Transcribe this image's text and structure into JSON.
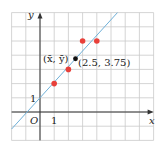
{
  "chart_data": {
    "type": "scatter",
    "title": "",
    "xlabel": "x",
    "ylabel": "y",
    "xlim": [
      -2,
      8
    ],
    "ylim": [
      -2,
      7
    ],
    "grid": true,
    "origin_label": "O",
    "tick_labels": {
      "x": [
        "1"
      ],
      "y": [
        "1"
      ]
    },
    "series": [
      {
        "name": "data points",
        "color": "#e8403a",
        "points": [
          [
            1,
            2
          ],
          [
            2,
            3
          ],
          [
            3,
            5
          ],
          [
            4,
            5
          ]
        ]
      },
      {
        "name": "mean point",
        "color": "#111111",
        "points": [
          [
            2.5,
            3.75
          ]
        ]
      },
      {
        "name": "regression line",
        "type": "line",
        "color": "#6fb0d8",
        "equation": "y = 1.1x + 1",
        "slope": 1.1,
        "intercept": 1
      }
    ],
    "annotations": [
      {
        "text": "(x̄, ȳ)",
        "at": [
          2.5,
          3.75
        ],
        "position": "left"
      },
      {
        "text": "(2.5, 3.75)",
        "at": [
          2.5,
          3.75
        ],
        "position": "right-below"
      }
    ]
  },
  "labels": {
    "x_axis": "x",
    "y_axis": "y",
    "origin": "O",
    "x_tick_1": "1",
    "y_tick_1": "1",
    "mean_symbol": "(x̄, ȳ)",
    "mean_value": "(2.5, 3.75)"
  }
}
